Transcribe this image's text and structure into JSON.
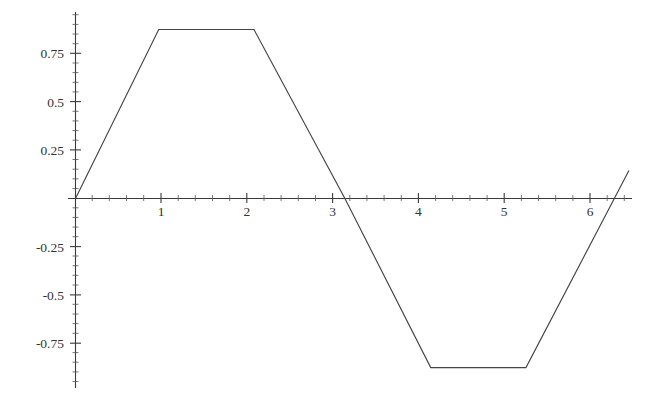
{
  "chart_data": {
    "type": "line",
    "title": "",
    "subtitle": "",
    "xlabel": "",
    "ylabel": "",
    "xlim": [
      -0.08,
      6.47
    ],
    "ylim": [
      -1.02,
      1.02
    ],
    "grid": false,
    "legend": null,
    "annotations": [],
    "x_ticks_major": [
      1,
      2,
      3,
      4,
      5,
      6
    ],
    "x_tick_labels": [
      "1",
      "2",
      "3",
      "4",
      "5",
      "6"
    ],
    "x_ticks_minor": [
      0.2,
      0.4,
      0.6,
      0.8,
      1.2,
      1.4,
      1.6,
      1.8,
      2.2,
      2.4,
      2.6,
      2.8,
      3.2,
      3.4,
      3.6,
      3.8,
      4.2,
      4.4,
      4.6,
      4.8,
      5.2,
      5.4,
      5.6,
      5.8,
      6.2,
      6.4
    ],
    "y_ticks_major": [
      0.75,
      0.5,
      0.25,
      -0.25,
      -0.5,
      -0.75
    ],
    "y_tick_labels": [
      "0.75",
      "0.5",
      "0.25",
      "-0.25",
      "-0.5",
      "-0.75"
    ],
    "y_ticks_minor": [
      0.95,
      0.9,
      0.85,
      0.8,
      0.7,
      0.65,
      0.6,
      0.55,
      0.45,
      0.4,
      0.35,
      0.3,
      0.2,
      0.15,
      0.1,
      0.05,
      -0.05,
      -0.1,
      -0.15,
      -0.2,
      -0.3,
      -0.35,
      -0.4,
      -0.45,
      -0.55,
      -0.6,
      -0.65,
      -0.7,
      -0.8,
      -0.85,
      -0.9,
      -0.95
    ],
    "series": [
      {
        "name": "trapezoidal-wave",
        "description": "Clipped sine / trapezoidal wave, amplitude 0.875, period 2 pi",
        "color": "#444444",
        "points": [
          [
            0.0,
            0.0
          ],
          [
            0.97,
            0.875
          ],
          [
            2.08,
            0.875
          ],
          [
            3.14,
            0.0
          ],
          [
            4.14,
            -0.875
          ],
          [
            5.25,
            -0.875
          ],
          [
            6.28,
            0.0
          ],
          [
            6.45,
            0.145
          ]
        ]
      }
    ]
  },
  "axes": {
    "x_axis_label": "",
    "y_axis_label": "",
    "origin_label": ""
  }
}
